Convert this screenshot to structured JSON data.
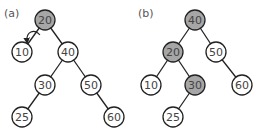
{
  "panels": [
    {
      "label": "(a)",
      "label_pos": [
        4,
        17
      ],
      "nodes": [
        {
          "id": "a20",
          "value": "20",
          "x": 45,
          "y": 20,
          "highlight": true
        },
        {
          "id": "a10",
          "value": "10",
          "x": 22,
          "y": 52,
          "highlight": false
        },
        {
          "id": "a40",
          "value": "40",
          "x": 68,
          "y": 52,
          "highlight": false
        },
        {
          "id": "a30",
          "value": "30",
          "x": 45,
          "y": 85,
          "highlight": false
        },
        {
          "id": "a50",
          "value": "50",
          "x": 91,
          "y": 85,
          "highlight": false
        },
        {
          "id": "a25",
          "value": "25",
          "x": 22,
          "y": 117,
          "highlight": false
        },
        {
          "id": "a60",
          "value": "60",
          "x": 114,
          "y": 117,
          "highlight": false
        }
      ],
      "edges": [
        [
          "a20",
          "a10"
        ],
        [
          "a20",
          "a40"
        ],
        [
          "a40",
          "a30"
        ],
        [
          "a40",
          "a50"
        ],
        [
          "a30",
          "a25"
        ],
        [
          "a50",
          "a60"
        ]
      ],
      "annotation": "rotation-arrow"
    },
    {
      "label": "(b)",
      "label_pos": [
        138,
        17
      ],
      "nodes": [
        {
          "id": "b40",
          "value": "40",
          "x": 195,
          "y": 20,
          "highlight": true
        },
        {
          "id": "b20",
          "value": "20",
          "x": 173,
          "y": 52,
          "highlight": true
        },
        {
          "id": "b50",
          "value": "50",
          "x": 216,
          "y": 52,
          "highlight": false
        },
        {
          "id": "b10",
          "value": "10",
          "x": 151,
          "y": 85,
          "highlight": false
        },
        {
          "id": "b30",
          "value": "30",
          "x": 195,
          "y": 85,
          "highlight": true
        },
        {
          "id": "b60",
          "value": "60",
          "x": 242,
          "y": 85,
          "highlight": false
        },
        {
          "id": "b25",
          "value": "25",
          "x": 173,
          "y": 117,
          "highlight": false
        }
      ],
      "edges": [
        [
          "b40",
          "b20"
        ],
        [
          "b40",
          "b50"
        ],
        [
          "b20",
          "b10"
        ],
        [
          "b20",
          "b30"
        ],
        [
          "b50",
          "b60"
        ],
        [
          "b30",
          "b25"
        ]
      ]
    }
  ],
  "colors": {
    "highlight_fill": "#a6a6a6",
    "normal_fill": "#ffffff",
    "stroke": "#222222"
  },
  "node_radius": 10
}
